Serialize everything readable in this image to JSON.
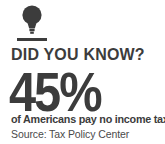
{
  "card": {
    "background_color": "#ffffff",
    "text_color": "#3c3c3c",
    "source_text_color": "#4a4a4a",
    "icon": {
      "name": "lightbulb-icon",
      "color": "#3c3c3c"
    },
    "divider": {
      "name": "divider-rule",
      "color": "#3c3c3c"
    },
    "headline": "DID YOU KNOW?",
    "stat_value": "45%",
    "stat_caption": "of Americans pay no income tax.",
    "source": "Source: Tax Policy Center"
  }
}
